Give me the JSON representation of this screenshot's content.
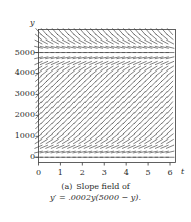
{
  "figure": {
    "caption_tag": "(a)",
    "caption_text": "Slope field of",
    "caption_formula": "y′ = .0002y(5000 − y).",
    "line_color": "#3a3a3a",
    "axis_color": "#3a3a3a",
    "background": "#ffffff"
  },
  "axes": {
    "x_axis_label": "t",
    "y_axis_label": "y",
    "x_ticks": [
      "0",
      "1",
      "2",
      "3",
      "4",
      "5",
      "6"
    ],
    "y_ticks": [
      "0",
      "1000",
      "2000",
      "3000",
      "4000",
      "5000"
    ]
  },
  "chart_data": {
    "type": "scatter",
    "title": "Slope field of y′ = .0002y(5000 − y).",
    "subtitle": "",
    "xlabel": "t",
    "ylabel": "y",
    "xlim": [
      0,
      6.25
    ],
    "ylim": [
      -250,
      6100
    ],
    "x_ticks": [
      0,
      1,
      2,
      3,
      4,
      5,
      6
    ],
    "y_ticks": [
      0,
      1000,
      2000,
      3000,
      4000,
      5000
    ],
    "grid": false,
    "legend": "none",
    "equation": "y' = 0.0002*y*(5000 - y)",
    "equation_coefficient": 0.0002,
    "equation_carrying_capacity": 5000,
    "field_description": "Direction field of the logistic differential equation: slope at each point (t, y) is 0.0002*y*(5000 - y); slopes are zero along y = 0 and y = 5000, steepest positive near y = 2500, and negative above y = 5000.",
    "field_grid": {
      "t_values": [
        0,
        0.25,
        0.5,
        0.75,
        1,
        1.25,
        1.5,
        1.75,
        2,
        2.25,
        2.5,
        2.75,
        3,
        3.25,
        3.5,
        3.75,
        4,
        4.25,
        4.5,
        4.75,
        5,
        5.25,
        5.5,
        5.75,
        6
      ],
      "y_values": [
        0,
        250,
        500,
        750,
        1000,
        1250,
        1500,
        1750,
        2000,
        2250,
        2500,
        2750,
        3000,
        3250,
        3500,
        3750,
        4000,
        4250,
        4500,
        4750,
        5000,
        5250,
        5500,
        5750,
        6000
      ],
      "slope_samples": [
        {
          "y": 0,
          "slope": 0
        },
        {
          "y": 250,
          "slope": 237.5
        },
        {
          "y": 500,
          "slope": 450
        },
        {
          "y": 750,
          "slope": 637.5
        },
        {
          "y": 1000,
          "slope": 800
        },
        {
          "y": 1250,
          "slope": 937.5
        },
        {
          "y": 1500,
          "slope": 1050
        },
        {
          "y": 1750,
          "slope": 1137.5
        },
        {
          "y": 2000,
          "slope": 1200
        },
        {
          "y": 2250,
          "slope": 1237.5
        },
        {
          "y": 2500,
          "slope": 1250
        },
        {
          "y": 2750,
          "slope": 1237.5
        },
        {
          "y": 3000,
          "slope": 1200
        },
        {
          "y": 3250,
          "slope": 1137.5
        },
        {
          "y": 3500,
          "slope": 1050
        },
        {
          "y": 3750,
          "slope": 937.5
        },
        {
          "y": 4000,
          "slope": 800
        },
        {
          "y": 4250,
          "slope": 637.5
        },
        {
          "y": 4500,
          "slope": 450
        },
        {
          "y": 4750,
          "slope": 237.5
        },
        {
          "y": 5000,
          "slope": 0
        },
        {
          "y": 5250,
          "slope": -262.5
        },
        {
          "y": 5500,
          "slope": -550
        },
        {
          "y": 5750,
          "slope": -862.5
        },
        {
          "y": 6000,
          "slope": -1200
        }
      ]
    }
  }
}
